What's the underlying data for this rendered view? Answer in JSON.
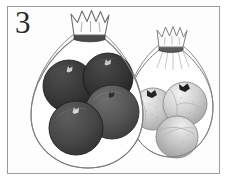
{
  "card": {
    "numeral": "3",
    "frame_color": "#9b9b9b",
    "background_color": "#ffffff"
  },
  "illustration": {
    "title": "Two bags of fruit",
    "description": "A transparent bag holding four dark apples and a smaller transparent bag holding three light pomegranates.",
    "bags": [
      {
        "name": "left-bag",
        "label": "Bag of dark apples",
        "tie_style": "crown-knot",
        "tie_band_color": "#4a4a4a",
        "outline_color": "#8a8a8a",
        "fruit_count": 4,
        "fruit_kind": "apple",
        "fruits": [
          {
            "name": "apple-back-left",
            "fill": "#3b3b3b",
            "shade": "#2a2a2a",
            "stem": "#cfcfcf",
            "stem_visible": "true"
          },
          {
            "name": "apple-back-right",
            "fill": "#3a3a3a",
            "shade": "#272727",
            "stem": "#c9c9c9",
            "stem_visible": "true"
          },
          {
            "name": "apple-middle",
            "fill": "#5a5a5a",
            "shade": "#414141",
            "stem": "#2e2e2e",
            "stem_visible": "true"
          },
          {
            "name": "apple-front-left",
            "fill": "#4a4a4a",
            "shade": "#363636",
            "stem": "#d6d6d6",
            "stem_visible": "true"
          }
        ]
      },
      {
        "name": "right-bag",
        "label": "Bag of light pomegranates",
        "tie_style": "crown-knot",
        "tie_band_color": "#5a5a5a",
        "outline_color": "#8a8a8a",
        "fruit_count": 3,
        "fruit_kind": "pomegranate",
        "fruits": [
          {
            "name": "pomegranate-left",
            "fill": "#c3c3c3",
            "shade": "#ababab",
            "stem": "#232323",
            "stem_visible": "true"
          },
          {
            "name": "pomegranate-right",
            "fill": "#cfcfcf",
            "shade": "#b2b2b2",
            "stem": "#1f1f1f",
            "stem_visible": "true"
          },
          {
            "name": "pomegranate-bottom",
            "fill": "#c9c9c9",
            "shade": "#a6a6a6",
            "stem": "#9c9c9c",
            "stem_visible": "false"
          }
        ]
      }
    ],
    "colors": {
      "dark_fruit": "#3a3a3a",
      "medium_fruit": "#5a5a5a",
      "light_fruit": "#c8c8c8",
      "outline": "#8a8a8a",
      "ink": "#2b2b2b"
    }
  }
}
